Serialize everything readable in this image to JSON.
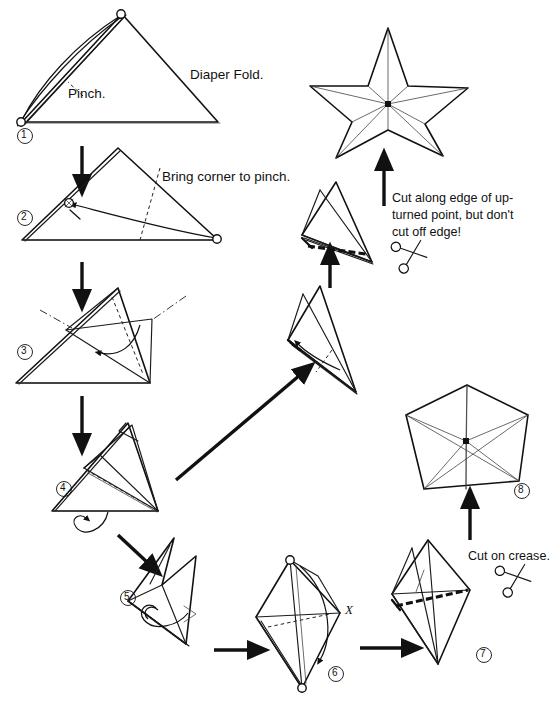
{
  "diagram": {
    "background_color": "#ffffff",
    "ink_color": "#111111"
  },
  "annotations": {
    "diaper_fold": "Diaper Fold.",
    "pinch": "Pinch.",
    "bring_corner": "Bring corner to pinch.",
    "cut_along_edge_line1": "Cut along edge of up-",
    "cut_along_edge_line2": "turned point, but don't",
    "cut_along_edge_line3": "cut off edge!",
    "cut_on_crease": "Cut on crease.",
    "x_mark": "X"
  },
  "steps": [
    {
      "id": "1",
      "number": "①",
      "label": "Diaper fold triangle with pinch mark"
    },
    {
      "id": "2",
      "number": "②",
      "label": "Bring corner to pinch"
    },
    {
      "id": "3",
      "number": "③",
      "label": "Fold flap across"
    },
    {
      "id": "4",
      "number": "④",
      "label": "Folded cone, turn over"
    },
    {
      "id": "5",
      "number": "⑤",
      "label": "Narrow folded form, flip"
    },
    {
      "id": "6",
      "number": "⑥",
      "label": "Kite shape with X corner"
    },
    {
      "id": "7",
      "number": "⑦",
      "label": "Cut on crease"
    },
    {
      "id": "8",
      "number": "⑧",
      "label": "Pentagon with radial creases"
    }
  ],
  "icons": {
    "scissors_upper": "scissors-icon",
    "scissors_lower": "scissors-icon"
  },
  "results": {
    "star": "five-pointed-star",
    "pentagon": "pentagon-with-creases"
  }
}
